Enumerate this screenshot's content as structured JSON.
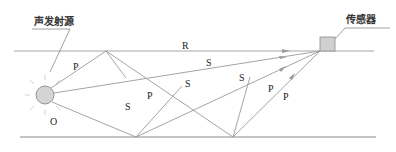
{
  "labels": {
    "source": "声发射源",
    "sensor": "传感器",
    "origin": "O"
  },
  "wave_labels": [
    {
      "text": "R",
      "x": 182,
      "y": 40
    },
    {
      "text": "S",
      "x": 207,
      "y": 60
    },
    {
      "text": "P",
      "x": 75,
      "y": 63
    },
    {
      "text": "S",
      "x": 125,
      "y": 87
    },
    {
      "text": "P",
      "x": 150,
      "y": 91
    },
    {
      "text": "S",
      "x": 185,
      "y": 80
    },
    {
      "text": "S",
      "x": 239,
      "y": 75
    },
    {
      "text": "P",
      "x": 270,
      "y": 86
    },
    {
      "text": "P",
      "x": 284,
      "y": 96
    },
    {
      "text": "P",
      "x": 118,
      "y": 95
    }
  ],
  "colors": {
    "line": "#9a9a9a",
    "boundary": "#a8a8a8",
    "source_fill": "#d4d4d4",
    "source_stroke": "#8a8a8a",
    "sensor_fill": "#d0d0d0",
    "text": "#222222"
  }
}
